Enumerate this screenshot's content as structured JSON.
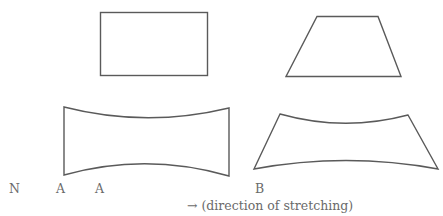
{
  "diagram": {
    "type": "shape-deformation-illustration",
    "stroke_color": "#5a5a5a",
    "text_color": "#6a6a6a",
    "shapes": [
      {
        "name": "original-rectangle",
        "form": "rectangle",
        "row": "top",
        "column": "left"
      },
      {
        "name": "original-trapezoid",
        "form": "trapezoid",
        "row": "top",
        "column": "right"
      },
      {
        "name": "stretched-rectangle",
        "form": "concave-sided rectangle",
        "row": "bottom",
        "column": "left"
      },
      {
        "name": "stretched-trapezoid",
        "form": "concave-sided trapezoid",
        "row": "bottom",
        "column": "right"
      }
    ],
    "labels": {
      "n": "N",
      "a1": "A",
      "a2": "A",
      "b": "B",
      "direction": "→ (direction of stretching)"
    }
  }
}
